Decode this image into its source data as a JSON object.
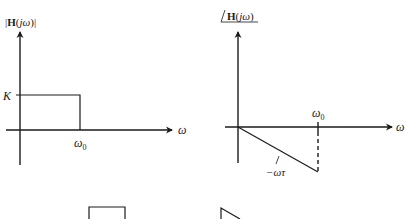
{
  "left_plot": {
    "title": {
      "prefix": "|",
      "bold": "H",
      "open": "(",
      "italic": "jω",
      "close": ")|"
    },
    "y_tick_label": "K",
    "x_axis_label": "ω",
    "x_tick_label": "ω",
    "x_tick_sub": "0"
  },
  "right_plot": {
    "title": {
      "angle": "∠",
      "bold": "H",
      "open": "(",
      "italic": "jω",
      "close": ")"
    },
    "x_axis_label": "ω",
    "x_tick_label": "ω",
    "x_tick_sub": "0",
    "slope_label": "−ωτ"
  },
  "colors": {
    "ink": "#1a1a1a",
    "background": "#ffffff"
  }
}
